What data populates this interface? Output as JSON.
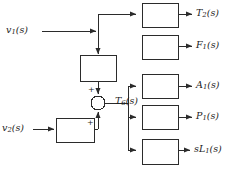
{
  "diagram": {
    "background_color": "#ffffff",
    "line_color": "#2b2b2b",
    "box_fill": "#ffffff",
    "inputs": [
      {
        "id": "v1",
        "label_main": "v",
        "label_sub": "1",
        "label_tail": "(s)"
      },
      {
        "id": "v2",
        "label_main": "v",
        "label_sub": "2",
        "label_tail": "(s)"
      }
    ],
    "intermediate": {
      "id": "T6",
      "label_main": "T",
      "label_sub": "6",
      "label_tail": "(s)"
    },
    "sum_junction": {
      "name": "summing-junction",
      "sign_top": "+",
      "sign_bottom": "+"
    },
    "blocks": [
      {
        "id": "block-top",
        "name": "gain-block-v1"
      },
      {
        "id": "block-v2",
        "name": "gain-block-v2"
      },
      {
        "id": "block-t2",
        "name": "output-block-t2"
      },
      {
        "id": "block-f1",
        "name": "output-block-f1"
      },
      {
        "id": "block-a1",
        "name": "output-block-a1"
      },
      {
        "id": "block-p1",
        "name": "output-block-p1"
      },
      {
        "id": "block-sl1",
        "name": "output-block-sl1"
      }
    ],
    "outputs": [
      {
        "id": "T2",
        "label_main": "T",
        "label_sub": "2",
        "label_tail": "(s)"
      },
      {
        "id": "F1",
        "label_main": "F",
        "label_sub": "1",
        "label_tail": "(s)"
      },
      {
        "id": "A1",
        "label_main": "A",
        "label_sub": "1",
        "label_tail": "(s)"
      },
      {
        "id": "P1",
        "label_main": "P",
        "label_sub": "1",
        "label_tail": "(s)"
      },
      {
        "id": "sL1",
        "label_main": "sL",
        "label_sub": "1",
        "label_tail": "(s)"
      }
    ]
  }
}
